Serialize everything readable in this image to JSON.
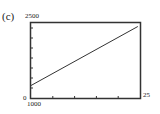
{
  "panel_label": "(c)",
  "chart_data": {
    "type": "line",
    "title": "",
    "xlabel": "",
    "ylabel": "",
    "xlim": [
      0,
      25
    ],
    "ylim": [
      1000,
      2500
    ],
    "x_tick_labels": {
      "min": "0",
      "max": "25"
    },
    "y_tick_labels": {
      "min": "1000",
      "max": "2500"
    },
    "grid": false,
    "series": [
      {
        "name": "line",
        "x": [
          0,
          24.5
        ],
        "y": [
          1250,
          2430
        ]
      }
    ]
  },
  "labels": {
    "ymax": "2500",
    "ymin": "1000",
    "xmin": "0",
    "xmax": "25"
  }
}
